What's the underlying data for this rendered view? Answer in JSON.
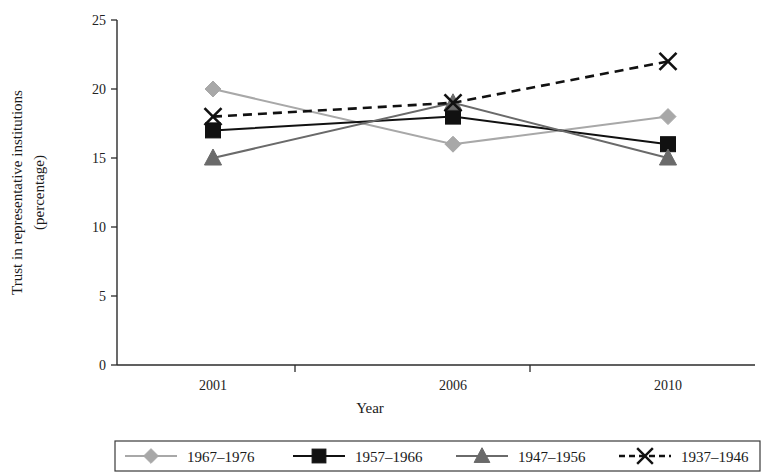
{
  "chart_data": {
    "type": "line",
    "title": "",
    "xlabel": "Year",
    "ylabel": "Trust in representative institutions (percentage)",
    "ylabel_line1": "Trust in representative institutions",
    "ylabel_line2": "(percentage)",
    "categories": [
      "2001",
      "2006",
      "2010"
    ],
    "ylim": [
      0,
      25
    ],
    "yticks": [
      0,
      5,
      10,
      15,
      20,
      25
    ],
    "ytick_labels": [
      "0",
      "5",
      "10",
      "15",
      "20",
      "25"
    ],
    "grid": false,
    "legend_position": "bottom",
    "series": [
      {
        "name": "1967–1976",
        "values": [
          20,
          16,
          18
        ],
        "color": "#a8a8a8",
        "marker": "diamond",
        "line_style": "solid"
      },
      {
        "name": "1957–1966",
        "values": [
          17,
          18,
          16
        ],
        "color": "#111111",
        "marker": "square",
        "line_style": "solid"
      },
      {
        "name": "1947–1956",
        "values": [
          15,
          19,
          15
        ],
        "color": "#6a6a6a",
        "marker": "triangle",
        "line_style": "solid"
      },
      {
        "name": "1937–1946",
        "values": [
          18,
          19,
          22
        ],
        "color": "#111111",
        "marker": "cross",
        "line_style": "dashed"
      }
    ]
  },
  "legend": {
    "items": [
      {
        "label": "1967–1976",
        "color": "#a8a8a8",
        "marker": "diamond",
        "line_style": "solid"
      },
      {
        "label": "1957–1966",
        "color": "#111111",
        "marker": "square",
        "line_style": "solid"
      },
      {
        "label": "1947–1956",
        "color": "#6a6a6a",
        "marker": "triangle",
        "line_style": "solid"
      },
      {
        "label": "1937–1946",
        "color": "#111111",
        "marker": "cross",
        "line_style": "dashed"
      }
    ]
  }
}
